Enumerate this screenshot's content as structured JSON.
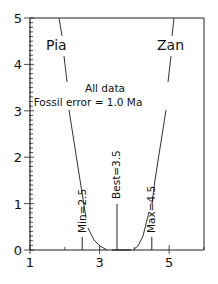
{
  "chart_data": {
    "type": "line",
    "title": "",
    "xlabel": "",
    "ylabel": "",
    "xlim": [
      1,
      6
    ],
    "ylim": [
      0,
      5
    ],
    "x_ticks": [
      1,
      3,
      5
    ],
    "x_tick_labels": [
      "1",
      "3",
      "5"
    ],
    "y_ticks": [
      0,
      1,
      2,
      3,
      4,
      5
    ],
    "y_tick_labels": [
      "0",
      "1",
      "2",
      "3",
      "4",
      "5"
    ],
    "grid": false,
    "annotations": {
      "header_line1": "All data",
      "header_line2": "Fossil error = 1.0 Ma",
      "left_label": "Pia",
      "right_label": "Zan",
      "min_label": "Min=2.5",
      "best_label": "Best=3.5",
      "max_label": "Max=4.5"
    },
    "markers": [
      {
        "name": "Min",
        "x": 2.5
      },
      {
        "name": "Best",
        "x": 3.5
      },
      {
        "name": "Max",
        "x": 4.5
      }
    ],
    "series": [
      {
        "name": "Pia",
        "x": [
          2.0,
          2.3,
          2.5,
          2.7,
          3.0,
          3.2,
          3.35
        ],
        "y": [
          5.0,
          3.7,
          2.7,
          1.0,
          0.2,
          0.05,
          0.0
        ]
      },
      {
        "name": "Zan",
        "x": [
          3.9,
          4.1,
          4.4,
          4.6,
          4.85,
          5.2
        ],
        "y": [
          0.0,
          0.25,
          0.9,
          2.7,
          3.7,
          5.0
        ]
      }
    ]
  }
}
